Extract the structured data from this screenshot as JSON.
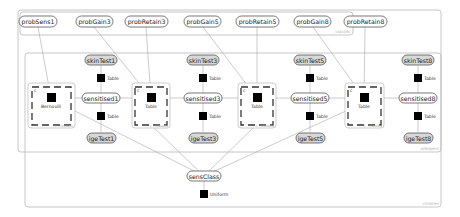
{
  "frames": {
    "classes": "classes",
    "allergens": "allergens",
    "children": "children"
  },
  "top_nodes": [
    {
      "id": "probSens1",
      "label": "probSens1",
      "x": 38
    },
    {
      "id": "probGain3",
      "label": "probGain3",
      "x": 94
    },
    {
      "id": "probRetain3",
      "label": "probRetain3",
      "x": 146
    },
    {
      "id": "probGain5",
      "label": "probGain5",
      "x": 203
    },
    {
      "id": "probRetain5",
      "label": "probRetain5",
      "x": 257
    },
    {
      "id": "probGain8",
      "label": "probGain8",
      "x": 313
    },
    {
      "id": "probRetain8",
      "label": "probRetain8",
      "x": 365
    }
  ],
  "allergens": [
    {
      "sensitised": "sensitised1",
      "skinTest": "skinTest1",
      "igeTest": "igeTest1",
      "x": 101,
      "gate_factor": "Bernoulli",
      "gate_x": 51
    },
    {
      "sensitised": "sensitised3",
      "skinTest": "skinTest3",
      "igeTest": "igeTest3",
      "x": 203,
      "gate_factor": "Table",
      "gate_x": 151
    },
    {
      "sensitised": "sensitised5",
      "skinTest": "skinTest5",
      "igeTest": "igeTest5",
      "x": 310,
      "gate_factor": "Table",
      "gate_x": 257
    },
    {
      "sensitised": "sensitised8",
      "skinTest": "skinTest8",
      "igeTest": "igeTest8",
      "x": 418,
      "gate_factor": "Table",
      "gate_x": 364
    }
  ],
  "factor_labels": {
    "skin_factor": "Table",
    "ige_factor": "Table",
    "sensClass_factor": "Uniform"
  },
  "gate": {
    "selector_label": "c",
    "caption": "c : classes"
  },
  "sensClass": {
    "label": "sensClass",
    "x": 204,
    "y": 176
  }
}
